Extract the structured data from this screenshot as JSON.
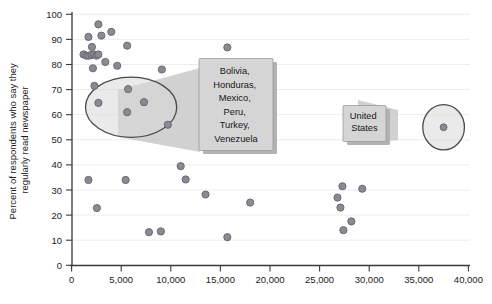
{
  "chart_data": {
    "type": "scatter",
    "title": "",
    "xlabel": "",
    "ylabel": "Percent of respondents who say they regularly read newspaper",
    "xlim": [
      0,
      40000
    ],
    "ylim": [
      0,
      100
    ],
    "grid": true,
    "legend": "none",
    "x_ticks": [
      "0",
      "5,000",
      "10,000",
      "15,000",
      "20,000",
      "25,000",
      "30,000",
      "35,000",
      "40,000"
    ],
    "x_tick_values": [
      0,
      5000,
      10000,
      15000,
      20000,
      25000,
      30000,
      35000,
      40000
    ],
    "y_ticks": [
      "0",
      "10",
      "20",
      "30",
      "40",
      "50",
      "60",
      "70",
      "80",
      "90",
      "100"
    ],
    "y_tick_values": [
      0,
      10,
      20,
      30,
      40,
      50,
      60,
      70,
      80,
      90,
      100
    ],
    "series": [
      {
        "name": "Countries",
        "points": [
          {
            "x": 2700,
            "y": 96
          },
          {
            "x": 1700,
            "y": 91
          },
          {
            "x": 3000,
            "y": 91.5
          },
          {
            "x": 4000,
            "y": 93
          },
          {
            "x": 1200,
            "y": 84
          },
          {
            "x": 1500,
            "y": 83.5
          },
          {
            "x": 1750,
            "y": 83.5
          },
          {
            "x": 2000,
            "y": 83.8
          },
          {
            "x": 2250,
            "y": 84
          },
          {
            "x": 2500,
            "y": 83.5
          },
          {
            "x": 2700,
            "y": 84
          },
          {
            "x": 2050,
            "y": 87
          },
          {
            "x": 3400,
            "y": 81
          },
          {
            "x": 5600,
            "y": 87.5
          },
          {
            "x": 4600,
            "y": 79.5
          },
          {
            "x": 2150,
            "y": 78.5
          },
          {
            "x": 9100,
            "y": 78
          },
          {
            "x": 15700,
            "y": 86.8
          },
          {
            "x": 2300,
            "y": 71.5
          },
          {
            "x": 5700,
            "y": 70.2
          },
          {
            "x": 2700,
            "y": 64.7
          },
          {
            "x": 5600,
            "y": 61
          },
          {
            "x": 7300,
            "y": 65
          },
          {
            "x": 9700,
            "y": 56
          },
          {
            "x": 1700,
            "y": 34
          },
          {
            "x": 2550,
            "y": 22.8
          },
          {
            "x": 5450,
            "y": 34
          },
          {
            "x": 7800,
            "y": 13.2
          },
          {
            "x": 9000,
            "y": 13.5
          },
          {
            "x": 11000,
            "y": 39.5
          },
          {
            "x": 11500,
            "y": 34.2
          },
          {
            "x": 13500,
            "y": 28.2
          },
          {
            "x": 15700,
            "y": 11.2
          },
          {
            "x": 18000,
            "y": 25
          },
          {
            "x": 27300,
            "y": 31.5
          },
          {
            "x": 26800,
            "y": 27
          },
          {
            "x": 27100,
            "y": 23
          },
          {
            "x": 27400,
            "y": 14
          },
          {
            "x": 28200,
            "y": 17.5
          },
          {
            "x": 29300,
            "y": 30.5
          },
          {
            "x": 37500,
            "y": 55
          }
        ]
      }
    ],
    "annotations": [
      {
        "id": "cluster-1",
        "shape": "ellipse",
        "label_lines": [
          "Bolivia,",
          "Honduras,",
          "Mexico,",
          "Peru,",
          "Turkey,",
          "Venezuela"
        ],
        "label_text": "Bolivia, Honduras, Mexico, Peru, Turkey, Venezuela",
        "ellipse_center": [
          6000,
          63
        ],
        "ellipse_radii": [
          4600,
          12
        ]
      },
      {
        "id": "cluster-2",
        "shape": "ellipse",
        "label_lines": [
          "United",
          "States"
        ],
        "label_text": "United States",
        "ellipse_center": [
          37500,
          55
        ],
        "ellipse_radii": [
          2100,
          9
        ]
      }
    ],
    "colors": {
      "marker_fill": "#8a8a92",
      "marker_stroke": "#63636c",
      "gridline": "#ececec",
      "axis": "#3a3a3a",
      "callout_box": "#d5d5d5",
      "highlight_fill": "#d9d9d9",
      "text": "#161616"
    }
  }
}
